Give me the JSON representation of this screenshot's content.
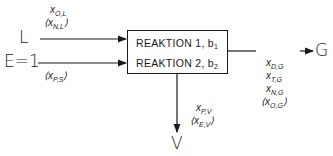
{
  "diagram": {
    "type": "process-block",
    "inputs": [
      {
        "id": "L",
        "label": "L",
        "annotations": [
          {
            "text": "x",
            "sub": "O,L",
            "bracketed": false
          },
          {
            "text": "x",
            "sub": "N,L",
            "bracketed": true
          }
        ]
      },
      {
        "id": "E",
        "label": "E=1",
        "annotations": [
          {
            "text": "x",
            "sub": "P,S",
            "bracketed": true
          }
        ]
      }
    ],
    "block": {
      "lines": [
        {
          "text": "REAKTION 1,  b",
          "sub": "1"
        },
        {
          "text": "REAKTION 2,  b",
          "sub": "2"
        }
      ]
    },
    "outputs": [
      {
        "id": "G",
        "label": "G",
        "annotations": [
          {
            "text": "x",
            "sub": "D,G",
            "bracketed": false
          },
          {
            "text": "x",
            "sub": "T,G",
            "bracketed": false
          },
          {
            "text": "x",
            "sub": "N,G",
            "bracketed": false
          },
          {
            "text": "x",
            "sub": "O,G",
            "bracketed": true
          }
        ]
      },
      {
        "id": "V",
        "label": "V",
        "annotations": [
          {
            "text": "x",
            "sub": "P,V",
            "bracketed": false
          },
          {
            "text": "x",
            "sub": "E,V",
            "bracketed": true
          }
        ]
      }
    ],
    "brackets": {
      "open": "⟨",
      "close": "⟩"
    }
  }
}
